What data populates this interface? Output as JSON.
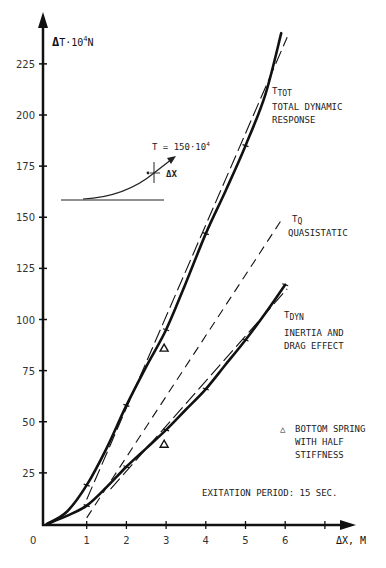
{
  "chart_data": {
    "type": "line",
    "title": "",
    "xlabel": "ΔX, M",
    "ylabel": "ΔT·10⁴N",
    "xlim": [
      0,
      7
    ],
    "ylim": [
      0,
      235
    ],
    "x_ticks": [
      0,
      1,
      2,
      3,
      4,
      5,
      6,
      7
    ],
    "x_tick_labels": [
      "0",
      "1",
      "2",
      "3",
      "4",
      "5",
      "6",
      ""
    ],
    "y_ticks": [
      25,
      50,
      75,
      100,
      125,
      150,
      175,
      200,
      225
    ],
    "y_tick_labels": [
      "25",
      "50",
      "75",
      "100",
      "125",
      "150",
      "175",
      "200",
      "225"
    ],
    "grid": false,
    "series": [
      {
        "name": "T_TOT total dynamic response",
        "style": "solid-thick",
        "x": [
          0,
          0.5,
          1,
          1.5,
          2,
          2.5,
          3,
          3.5,
          4,
          4.5,
          5,
          5.5,
          5.9
        ],
        "y": [
          0,
          6,
          19,
          37,
          58,
          77,
          95,
          118,
          142,
          163,
          185,
          210,
          240
        ]
      },
      {
        "name": "T_TOT dashed reference",
        "style": "dashed-long",
        "x": [
          1,
          6.05
        ],
        "y": [
          12,
          238
        ]
      },
      {
        "name": "T_Q quasistatic",
        "style": "dashed",
        "x": [
          1,
          5.95
        ],
        "y": [
          3,
          150
        ]
      },
      {
        "name": "T_DYN inertia and drag effect",
        "style": "solid-thick",
        "x": [
          0,
          0.5,
          1,
          1.5,
          2,
          2.5,
          3,
          3.5,
          4,
          4.5,
          5,
          5.5,
          6
        ],
        "y": [
          0,
          4,
          9,
          18,
          28,
          37,
          46,
          56,
          66,
          78,
          90,
          103,
          117
        ]
      },
      {
        "name": "T_DYN dashed reference",
        "style": "dashed-long",
        "x": [
          1.6,
          6.05
        ],
        "y": [
          17,
          115
        ]
      },
      {
        "name": "Bottom spring with half stiffness",
        "style": "triangle-marker",
        "x": [
          2.95,
          2.95
        ],
        "y": [
          86,
          39
        ]
      }
    ],
    "annotations": [
      {
        "text": "T_TOT",
        "sub": "TOT",
        "label": "TOTAL DYNAMIC RESPONSE"
      },
      {
        "text": "T_Q",
        "sub": "Q",
        "label": "QUASISTATIC"
      },
      {
        "text": "T_DYN",
        "sub": "DYN",
        "label": "INERTIA AND DRAG EFFECT"
      },
      {
        "text": "T = 150·10⁴"
      },
      {
        "text": "ΔX"
      },
      {
        "text": "BOTTOM SPRING WITH HALF STIFFNESS"
      },
      {
        "text": "EXITATION PERIOD: 15 SEC."
      }
    ]
  },
  "labels": {
    "y_axis_title_delta": "Δ",
    "y_axis_title": "T·10",
    "y_axis_title_exp": "4",
    "y_axis_title_unit": "N",
    "x_axis_title": "ΔX, M",
    "origin": "0",
    "ttot_main": "T",
    "ttot_sub": "TOT",
    "ttot_line1": "TOTAL DYNAMIC",
    "ttot_line2": "RESPONSE",
    "tq_main": "T",
    "tq_sub": "Q",
    "tq_line1": "QUASISTATIC",
    "tdyn_main": "T",
    "tdyn_sub": "DYN",
    "tdyn_line1": "INERTIA AND",
    "tdyn_line2": "DRAG EFFECT",
    "inset_t": "T = 150·10",
    "inset_exp": "4",
    "inset_dx": "ΔX",
    "legend_marker": "△",
    "legend_line1": "BOTTOM SPRING",
    "legend_line2": "WITH HALF",
    "legend_line3": "STIFFNESS",
    "period_note": "EXITATION PERIOD: 15 SEC."
  }
}
